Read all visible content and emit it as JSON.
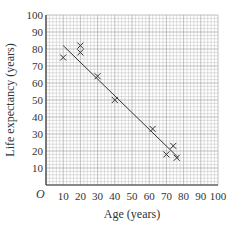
{
  "chart_data": {
    "type": "scatter",
    "title": "",
    "xlabel": "Age (years)",
    "ylabel": "Life expectancy (years)",
    "xlim": [
      0,
      100
    ],
    "ylim": [
      0,
      100
    ],
    "xticks": [
      10,
      20,
      30,
      40,
      50,
      60,
      70,
      80,
      90,
      100
    ],
    "yticks": [
      10,
      20,
      30,
      40,
      50,
      60,
      70,
      80,
      90,
      100
    ],
    "origin_label": "O",
    "grid": true,
    "points": [
      [
        10,
        75
      ],
      [
        20,
        78
      ],
      [
        20,
        82
      ],
      [
        30,
        64
      ],
      [
        40,
        50
      ],
      [
        62,
        33
      ],
      [
        70,
        18
      ],
      [
        74,
        23
      ],
      [
        76,
        16
      ]
    ],
    "trend_line": [
      [
        10,
        82
      ],
      [
        77,
        16
      ]
    ]
  }
}
